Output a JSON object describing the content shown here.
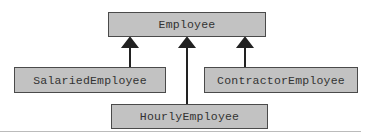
{
  "diagram": {
    "type": "uml-class-inheritance",
    "classes": {
      "parent": "Employee",
      "left": "SalariedEmployee",
      "middle": "HourlyEmployee",
      "right": "ContractorEmployee"
    },
    "relationships": [
      {
        "from": "SalariedEmployee",
        "to": "Employee",
        "type": "inheritance"
      },
      {
        "from": "HourlyEmployee",
        "to": "Employee",
        "type": "inheritance"
      },
      {
        "from": "ContractorEmployee",
        "to": "Employee",
        "type": "inheritance"
      }
    ],
    "colors": {
      "box_fill": "#c2c2c2",
      "box_border": "#4a4a4a",
      "arrow": "#222222",
      "rule": "#bbbbbb"
    }
  }
}
